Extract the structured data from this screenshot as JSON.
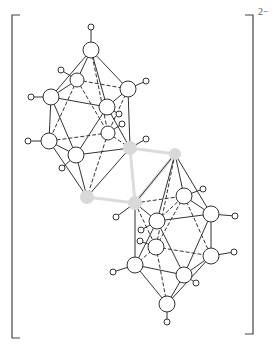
{
  "charge": "2−",
  "colors": {
    "line": "#333333",
    "atom_stroke": "#333333",
    "atom_fill": "#ffffff",
    "carbon_fill": "#d9d9d9",
    "carbon_bridge": "#dcdcdc",
    "bracket": "#444444"
  },
  "brackets": {
    "left": {
      "x": 12,
      "top": 15,
      "bottom": 338,
      "serif": 8
    },
    "right": {
      "x": 253,
      "top": 15,
      "bottom": 334,
      "serif": 8
    }
  },
  "atoms": [
    {
      "id": "u_top",
      "x": 91,
      "y": 50,
      "r": 8,
      "type": "B"
    },
    {
      "id": "u_b2",
      "x": 77,
      "y": 80,
      "r": 7,
      "type": "B"
    },
    {
      "id": "u_b3",
      "x": 51,
      "y": 97,
      "r": 8,
      "type": "B"
    },
    {
      "id": "u_b4",
      "x": 128,
      "y": 89,
      "r": 8,
      "type": "B"
    },
    {
      "id": "u_b5",
      "x": 107,
      "y": 107,
      "r": 8,
      "type": "B"
    },
    {
      "id": "u_b6",
      "x": 108,
      "y": 133,
      "r": 7,
      "type": "B"
    },
    {
      "id": "u_b7",
      "x": 49,
      "y": 141,
      "r": 8,
      "type": "B"
    },
    {
      "id": "u_b8",
      "x": 76,
      "y": 155,
      "r": 8,
      "type": "B"
    },
    {
      "id": "c1",
      "x": 130,
      "y": 148,
      "r": 7,
      "type": "C"
    },
    {
      "id": "c2",
      "x": 175,
      "y": 154,
      "r": 6,
      "type": "C"
    },
    {
      "id": "c3",
      "x": 87,
      "y": 197,
      "r": 7,
      "type": "C"
    },
    {
      "id": "c4",
      "x": 135,
      "y": 203,
      "r": 7,
      "type": "C"
    },
    {
      "id": "l_b1",
      "x": 157,
      "y": 221,
      "r": 8,
      "type": "B"
    },
    {
      "id": "l_b2",
      "x": 184,
      "y": 196,
      "r": 8,
      "type": "B"
    },
    {
      "id": "l_b3",
      "x": 211,
      "y": 214,
      "r": 8,
      "type": "B"
    },
    {
      "id": "l_b4",
      "x": 156,
      "y": 247,
      "r": 8,
      "type": "B"
    },
    {
      "id": "l_b5",
      "x": 211,
      "y": 256,
      "r": 8,
      "type": "B"
    },
    {
      "id": "l_b6",
      "x": 135,
      "y": 265,
      "r": 8,
      "type": "B"
    },
    {
      "id": "l_b7",
      "x": 184,
      "y": 275,
      "r": 8,
      "type": "B"
    },
    {
      "id": "l_bot",
      "x": 167,
      "y": 304,
      "r": 8,
      "type": "B"
    }
  ],
  "hydrogens": [
    {
      "on": "u_top",
      "x": 91,
      "y": 27
    },
    {
      "on": "u_b2",
      "x": 61,
      "y": 70
    },
    {
      "on": "u_b3",
      "x": 31,
      "y": 97
    },
    {
      "on": "u_b4",
      "x": 146,
      "y": 81
    },
    {
      "on": "u_b5",
      "x": 119,
      "y": 114
    },
    {
      "on": "u_b6",
      "x": 122,
      "y": 124
    },
    {
      "on": "u_b7",
      "x": 28,
      "y": 141
    },
    {
      "on": "u_b8",
      "x": 62,
      "y": 168
    },
    {
      "on": "c1",
      "x": 146,
      "y": 139
    },
    {
      "on": "c4",
      "x": 116,
      "y": 217
    },
    {
      "on": "l_b2",
      "x": 203,
      "y": 189
    },
    {
      "on": "l_b3",
      "x": 235,
      "y": 216
    },
    {
      "on": "l_b1",
      "x": 141,
      "y": 230
    },
    {
      "on": "l_b4",
      "x": 140,
      "y": 241
    },
    {
      "on": "l_b5",
      "x": 234,
      "y": 252
    },
    {
      "on": "l_b6",
      "x": 113,
      "y": 272
    },
    {
      "on": "l_b7",
      "x": 196,
      "y": 283
    },
    {
      "on": "l_bot",
      "x": 167,
      "y": 322
    }
  ],
  "bonds": [
    [
      "u_top",
      "u_b2",
      "solid"
    ],
    [
      "u_top",
      "u_b3",
      "solid"
    ],
    [
      "u_top",
      "u_b4",
      "solid"
    ],
    [
      "u_top",
      "u_b5",
      "solid"
    ],
    [
      "u_top",
      "u_b6",
      "dashed"
    ],
    [
      "u_b2",
      "u_b3",
      "solid"
    ],
    [
      "u_b2",
      "u_b4",
      "dashed"
    ],
    [
      "u_b2",
      "u_b7",
      "dashed"
    ],
    [
      "u_b2",
      "u_b6",
      "dashed"
    ],
    [
      "u_b3",
      "u_b5",
      "solid"
    ],
    [
      "u_b3",
      "u_b7",
      "solid"
    ],
    [
      "u_b3",
      "u_b8",
      "solid"
    ],
    [
      "u_b4",
      "u_b5",
      "solid"
    ],
    [
      "u_b4",
      "u_b6",
      "dashed"
    ],
    [
      "u_b4",
      "c1",
      "solid"
    ],
    [
      "u_b5",
      "u_b8",
      "solid"
    ],
    [
      "u_b5",
      "c1",
      "solid"
    ],
    [
      "u_b6",
      "u_b7",
      "dashed"
    ],
    [
      "u_b6",
      "c3",
      "dashed"
    ],
    [
      "u_b6",
      "c1",
      "dashed"
    ],
    [
      "u_b7",
      "u_b8",
      "solid"
    ],
    [
      "u_b7",
      "c3",
      "solid"
    ],
    [
      "u_b8",
      "c1",
      "solid"
    ],
    [
      "u_b8",
      "c3",
      "solid"
    ],
    [
      "c1",
      "c3",
      "solid"
    ],
    [
      "c2",
      "l_b1",
      "solid"
    ],
    [
      "c2",
      "l_b2",
      "solid"
    ],
    [
      "c2",
      "l_b3",
      "solid"
    ],
    [
      "c2",
      "c4",
      "solid"
    ],
    [
      "c2",
      "l_b4",
      "dashed"
    ],
    [
      "c4",
      "l_b1",
      "solid"
    ],
    [
      "c4",
      "l_b2",
      "dashed"
    ],
    [
      "c4",
      "l_b4",
      "dashed"
    ],
    [
      "c4",
      "l_b6",
      "solid"
    ],
    [
      "l_b1",
      "l_b2",
      "dashed"
    ],
    [
      "l_b1",
      "l_b3",
      "solid"
    ],
    [
      "l_b1",
      "l_b6",
      "solid"
    ],
    [
      "l_b1",
      "l_b7",
      "solid"
    ],
    [
      "l_b2",
      "l_b3",
      "solid"
    ],
    [
      "l_b2",
      "l_b5",
      "dashed"
    ],
    [
      "l_b2",
      "l_b4",
      "dashed"
    ],
    [
      "l_b3",
      "l_b5",
      "solid"
    ],
    [
      "l_b3",
      "l_b7",
      "solid"
    ],
    [
      "l_b4",
      "l_b5",
      "dashed"
    ],
    [
      "l_b4",
      "l_b6",
      "dashed"
    ],
    [
      "l_b4",
      "l_bot",
      "dashed"
    ],
    [
      "l_b5",
      "l_b7",
      "solid"
    ],
    [
      "l_b5",
      "l_bot",
      "solid"
    ],
    [
      "l_b6",
      "l_b7",
      "solid"
    ],
    [
      "l_b6",
      "l_bot",
      "solid"
    ],
    [
      "l_b7",
      "l_bot",
      "solid"
    ]
  ],
  "bridge_bonds": [
    [
      "c1",
      "c2"
    ],
    [
      "c1",
      "c4"
    ],
    [
      "c3",
      "c4"
    ],
    [
      "c2",
      "c4"
    ]
  ]
}
